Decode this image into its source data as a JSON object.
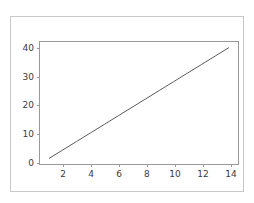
{
  "figure": {
    "background_color": "#ffffff",
    "border_color": "#c9c9c9",
    "axes_spine_color": "#9a9a9a",
    "tick_label_color": "#3b3b3b"
  },
  "chart_data": {
    "type": "line",
    "title": "",
    "xlabel": "",
    "ylabel": "",
    "grid": false,
    "legend": false,
    "line_color": "#5b5b5b",
    "line_width": 1,
    "xlim": [
      0.35,
      14.65
    ],
    "ylim": [
      -0.95,
      41.95
    ],
    "xticks": [
      2,
      4,
      6,
      8,
      10,
      12,
      14
    ],
    "yticks": [
      0,
      10,
      20,
      30,
      40
    ],
    "xticklabels": [
      "2",
      "4",
      "6",
      "8",
      "10",
      "12",
      "14"
    ],
    "yticklabels": [
      "0",
      "10",
      "20",
      "30",
      "40"
    ],
    "series": [
      {
        "name": "line",
        "x": [
          1,
          2,
          3,
          4,
          5,
          6,
          7,
          8,
          9,
          10,
          11,
          12,
          13,
          14
        ],
        "y": [
          1,
          4,
          7,
          10,
          13,
          16,
          19,
          22,
          25,
          28,
          31,
          34,
          37,
          40
        ]
      }
    ]
  }
}
